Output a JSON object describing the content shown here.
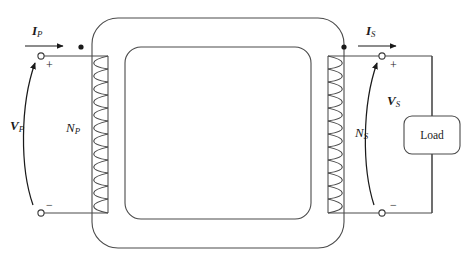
{
  "figure": {
    "type": "circuit-diagram",
    "background_color": "#ffffff",
    "line_color": "#3a3a3a",
    "text_color": "#1a1a1a"
  },
  "labels": {
    "primary_current": {
      "symbol": "I",
      "subscript": "P",
      "style": "bold-italic"
    },
    "secondary_current": {
      "symbol": "I",
      "subscript": "S",
      "style": "bold-italic"
    },
    "primary_voltage": {
      "symbol": "V",
      "subscript": "P",
      "style": "bold-italic"
    },
    "secondary_voltage": {
      "symbol": "V",
      "subscript": "S",
      "style": "bold-italic"
    },
    "primary_turns": {
      "symbol": "N",
      "subscript": "P",
      "style": "italic"
    },
    "secondary_turns": {
      "symbol": "N",
      "subscript": "S",
      "style": "italic"
    },
    "load_box": "Load"
  },
  "polarity": {
    "primary_top": "+",
    "primary_bottom": "−",
    "secondary_top": "+",
    "secondary_bottom": "−"
  },
  "markers": {
    "dot_convention_primary": "polarity-dot",
    "dot_convention_secondary": "polarity-dot",
    "terminal_count": 4
  },
  "windings": {
    "primary_turn_loops": 12,
    "secondary_turn_loops": 12
  }
}
